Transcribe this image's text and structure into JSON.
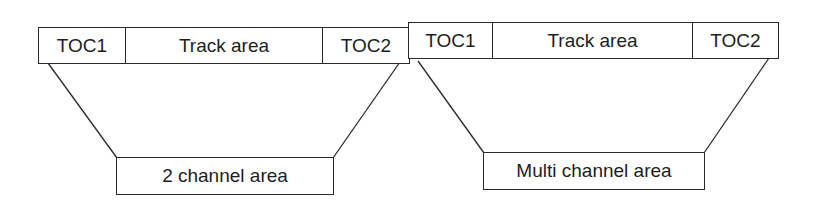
{
  "diagram": {
    "left_disc": {
      "segments": [
        "TOC1",
        "Track area",
        "TOC2"
      ],
      "area_label": "2 channel area"
    },
    "right_disc": {
      "segments": [
        "TOC1",
        "Track area",
        "TOC2"
      ],
      "area_label": "Multi channel area"
    },
    "line_color": "#2a2a2a"
  }
}
